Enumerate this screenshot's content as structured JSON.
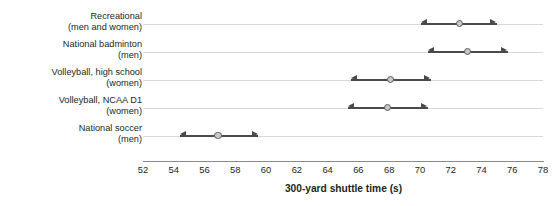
{
  "chart_data": {
    "type": "scatter",
    "title": "",
    "xlabel": "300-yard shuttle time (s)",
    "ylabel": "Group",
    "xlim": [
      52,
      78
    ],
    "xticks": [
      52,
      54,
      56,
      58,
      60,
      62,
      64,
      66,
      68,
      70,
      72,
      74,
      76,
      78
    ],
    "xtick_labels": [
      "52",
      "54",
      "56",
      "58",
      "60",
      "62",
      "64",
      "66",
      "68",
      "70",
      "72",
      "74",
      "76",
      "78"
    ],
    "grid": true,
    "grid_axis": "y",
    "legend": "none",
    "orientation": "horizontal",
    "marker": "circle-with-range-arrows",
    "categories": [
      "Recreational (men and women)",
      "National badminton (men)",
      "Volleyball, high school (women)",
      "Volleyball, NCAA D1 (women)",
      "National soccer (men)"
    ],
    "series": [
      {
        "name": "300-yard shuttle time (s)",
        "points": [
          {
            "category": "Recreational (men and women)",
            "value": 72.6,
            "low": 70.1,
            "high": 75.0
          },
          {
            "category": "National badminton (men)",
            "value": 73.1,
            "low": 70.5,
            "high": 75.7
          },
          {
            "category": "Volleyball, high school (women)",
            "value": 68.1,
            "low": 65.5,
            "high": 70.7
          },
          {
            "category": "Volleyball, NCAA D1 (women)",
            "value": 67.9,
            "low": 65.3,
            "high": 70.5
          },
          {
            "category": "National soccer (men)",
            "value": 56.9,
            "low": 54.4,
            "high": 59.5
          }
        ]
      }
    ]
  },
  "axes": {
    "y_title": "Group",
    "x_title": "300-yard shuttle time (s)"
  },
  "category_labels": [
    {
      "line1": "Recreational",
      "line2": "(men and women)"
    },
    {
      "line1": "National badminton",
      "line2": "(men)"
    },
    {
      "line1": "Volleyball, high school",
      "line2": "(women)"
    },
    {
      "line1": "Volleyball, NCAA D1",
      "line2": "(women)"
    },
    {
      "line1": "National soccer",
      "line2": "(men)"
    }
  ],
  "colors": {
    "marker_fill": "#c9c9c9",
    "marker_stroke": "#5b5b5b",
    "range_line": "#4a4a4a",
    "gridline": "#d8d8d8",
    "axis_line": "#8a8a8a",
    "text": "#231f20",
    "background": "#ffffff"
  }
}
